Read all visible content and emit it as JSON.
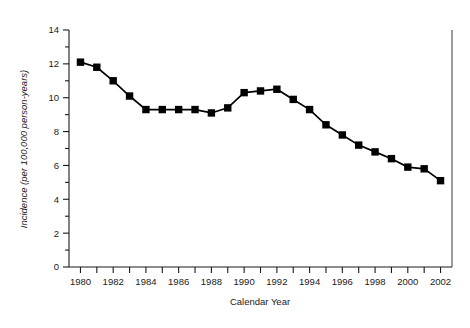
{
  "figure": {
    "background_color": "#ffffff",
    "ink_color": "#000000"
  },
  "chart_data": {
    "type": "line",
    "title": "",
    "subtitle": "",
    "xlabel": "Calendar Year",
    "ylabel": "Incidence (per 100,000 person-years)",
    "xlim": [
      1979.3,
      2002.7
    ],
    "ylim": [
      0,
      14
    ],
    "grid": false,
    "legend": null,
    "legend_position": "none",
    "marker": "filled-square",
    "line_color": "#000000",
    "marker_color": "#000000",
    "x": [
      1980,
      1981,
      1982,
      1983,
      1984,
      1985,
      1986,
      1987,
      1988,
      1989,
      1990,
      1991,
      1992,
      1993,
      1994,
      1995,
      1996,
      1997,
      1998,
      1999,
      2000,
      2001,
      2002
    ],
    "values": [
      12.1,
      11.8,
      11.0,
      10.1,
      9.3,
      9.3,
      9.3,
      9.3,
      9.1,
      9.4,
      10.3,
      10.4,
      10.5,
      9.9,
      9.3,
      8.4,
      7.8,
      7.2,
      6.8,
      6.4,
      5.9,
      5.8,
      5.1
    ],
    "series": [
      {
        "name": "Incidence",
        "values": [
          12.1,
          11.8,
          11.0,
          10.1,
          9.3,
          9.3,
          9.3,
          9.3,
          9.1,
          9.4,
          10.3,
          10.4,
          10.5,
          9.9,
          9.3,
          8.4,
          7.8,
          7.2,
          6.8,
          6.4,
          5.9,
          5.8,
          5.1
        ]
      }
    ],
    "y_ticks_major": [
      0,
      2,
      4,
      6,
      8,
      10,
      12,
      14
    ],
    "y_ticks_major_labels": [
      "0",
      "2",
      "4",
      "6",
      "8",
      "10",
      "12",
      "14"
    ],
    "y_ticks_minor": [
      1,
      3,
      5,
      7,
      9,
      11,
      13
    ],
    "x_ticks_all": [
      1980,
      1981,
      1982,
      1983,
      1984,
      1985,
      1986,
      1987,
      1988,
      1989,
      1990,
      1991,
      1992,
      1993,
      1994,
      1995,
      1996,
      1997,
      1998,
      1999,
      2000,
      2001,
      2002
    ],
    "x_ticks_labeled": [
      1980,
      1982,
      1984,
      1986,
      1988,
      1990,
      1992,
      1994,
      1996,
      1998,
      2000,
      2002
    ],
    "x_tick_labels": [
      "1980",
      "1982",
      "1984",
      "1986",
      "1988",
      "1990",
      "1992",
      "1994",
      "1996",
      "1998",
      "2000",
      "2002"
    ],
    "annotations": []
  }
}
